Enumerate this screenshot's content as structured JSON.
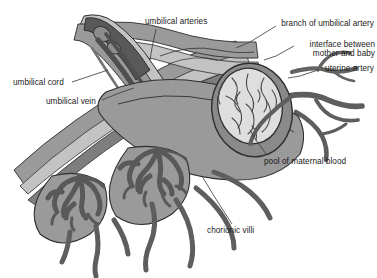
{
  "diagram": {
    "type": "anatomical-illustration",
    "background": "#ffffff",
    "palette": {
      "dark_gray": "#595959",
      "mid_gray": "#9a9a9a",
      "light_gray": "#c9c9c9",
      "pale_gray": "#e2e2e2",
      "outline": "#2e2e2e",
      "text": "#1b1b1b",
      "leader_line": "#3a3a3a"
    }
  },
  "labels": [
    {
      "id": "umbilical-arteries",
      "text": "umbilical arteries",
      "align": "left",
      "x": 145,
      "y": 17
    },
    {
      "id": "branch-of-umbilical-artery",
      "text": "branch of umbilical artery",
      "align": "right",
      "x": 279,
      "y": 19
    },
    {
      "id": "interface-between-mother-and-baby",
      "text": "interface between mother and baby",
      "line1": "interface between",
      "line2": "mother and baby",
      "align": "right",
      "x": 297,
      "y": 40
    },
    {
      "id": "uterine-artery",
      "text": "uterine artery",
      "align": "right",
      "x": 321,
      "y": 64
    },
    {
      "id": "umbilical-cord",
      "text": "umbilical cord",
      "align": "left",
      "x": 13,
      "y": 78
    },
    {
      "id": "umbilical-vein",
      "text": "umbilical vein",
      "align": "left",
      "x": 46,
      "y": 97
    },
    {
      "id": "pool-of-maternal-blood",
      "text": "pool of maternal blood",
      "align": "left",
      "x": 264,
      "y": 157
    },
    {
      "id": "chorionic-villi",
      "text": "chorionic villi",
      "align": "left",
      "x": 207,
      "y": 226
    }
  ],
  "structures": [
    {
      "id": "umbilical-cord",
      "description": "cut cord entering from upper left with vessel cross-sections"
    },
    {
      "id": "umbilical-arteries",
      "description": "two dark arteries running through cord"
    },
    {
      "id": "umbilical-vein",
      "description": "vein running through cord"
    },
    {
      "id": "chorionic-villi",
      "description": "branching coral-like villous trees in placental lobules"
    },
    {
      "id": "pool-of-maternal-blood",
      "description": "oval intervillous space at right containing villus mass"
    },
    {
      "id": "uterine-artery",
      "description": "branching maternal vessels at right"
    },
    {
      "id": "interface-between-mother-and-baby",
      "description": "basal plate boundary layer"
    },
    {
      "id": "amniotic-membrane",
      "description": "layered membranes sweeping to left"
    }
  ]
}
